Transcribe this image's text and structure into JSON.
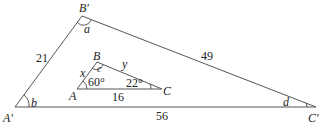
{
  "large_triangle": {
    "vertices": {
      "A": "A′",
      "B": "B′",
      "C": "C′"
    },
    "sides": {
      "AB": "21",
      "BC": "49",
      "AC": "56"
    },
    "angles": {
      "B": "a",
      "A": "b",
      "C": "d"
    }
  },
  "small_triangle": {
    "vertices": {
      "A": "A",
      "B": "B",
      "C": "C"
    },
    "sides": {
      "AB": "x",
      "BC": "y",
      "AC": "16"
    },
    "angles": {
      "B": "c",
      "A": "60°",
      "C": "22°"
    }
  },
  "colors": {
    "line": "#555555",
    "text": "#222222"
  }
}
